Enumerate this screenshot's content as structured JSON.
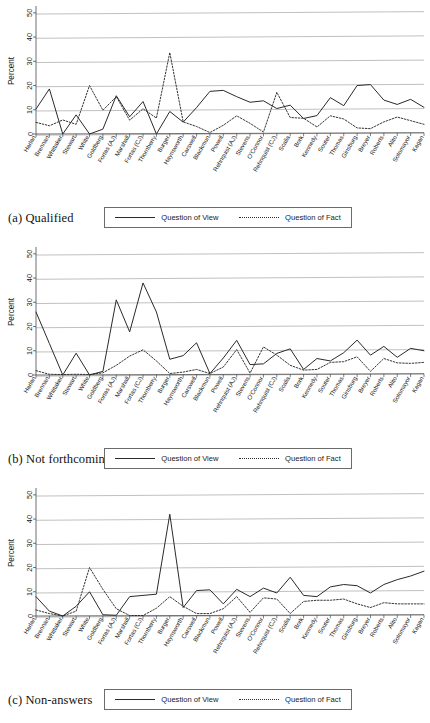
{
  "figure": {
    "ylabel": "Percent",
    "y_ticks": [
      0,
      10,
      20,
      30,
      40,
      50
    ],
    "ylim": [
      0,
      52
    ],
    "legend": {
      "view_label": "Question of View",
      "fact_label": "Question of Fact"
    },
    "colors": {
      "line": "#2a2a2a",
      "grid": "#b9b9b9",
      "axis": "#4a4a4a",
      "text": "#1a1a1a"
    },
    "categories": [
      "Harlan",
      "Brennan",
      "Whittaker",
      "Stewart",
      "White",
      "Goldberg",
      "Fortas (AJ)",
      "Marshall",
      "Fortas (CJ)",
      "Thornberry",
      "Burger",
      "Haynsworth",
      "Carswell",
      "Blackmun",
      "Powell",
      "Rehnquist (AJ)",
      "Stevens",
      "O'Connor",
      "Rehnquist (CJ)",
      "Scalia",
      "Bork",
      "Kennedy",
      "Souter",
      "Thomas",
      "Ginsburg",
      "Breyer",
      "Roberts",
      "Alito",
      "Sotomayor",
      "Kagan"
    ]
  },
  "panels": [
    {
      "id": "qualified",
      "caption": "(a) Qualified",
      "chart_data": {
        "type": "line",
        "title": "(a) Qualified",
        "xlabel": "",
        "ylabel": "Percent",
        "ylim": [
          0,
          52
        ],
        "grid": true,
        "legend_position": "bottom",
        "categories": [
          "Harlan",
          "Brennan",
          "Whittaker",
          "Stewart",
          "White",
          "Goldberg",
          "Fortas (AJ)",
          "Marshall",
          "Fortas (CJ)",
          "Thornberry",
          "Burger",
          "Haynsworth",
          "Carswell",
          "Blackmun",
          "Powell",
          "Rehnquist (AJ)",
          "Stevens",
          "O'Connor",
          "Rehnquist (CJ)",
          "Scalia",
          "Bork",
          "Kennedy",
          "Souter",
          "Thomas",
          "Ginsburg",
          "Breyer",
          "Roberts",
          "Alito",
          "Sotomayor",
          "Kagan"
        ],
        "series": [
          {
            "name": "Question of View",
            "style": "solid",
            "values": [
              10.3,
              18.6,
              0.0,
              7.9,
              0.0,
              2.0,
              15.8,
              7.1,
              13.4,
              0.0,
              9.3,
              4.9,
              10.9,
              17.6,
              18.0,
              15.4,
              13.1,
              13.7,
              10.5,
              11.9,
              6.4,
              7.6,
              15.0,
              11.7,
              20.0,
              20.4,
              14.0,
              12.2,
              14.3,
              11.0
            ]
          },
          {
            "name": "Question of Fact",
            "style": "dotted",
            "values": [
              4.8,
              3.4,
              5.8,
              4.0,
              20.0,
              9.8,
              15.4,
              5.7,
              10.4,
              6.6,
              33.6,
              5.0,
              3.1,
              0.6,
              3.6,
              7.5,
              4.4,
              0.8,
              17.2,
              6.8,
              6.5,
              2.9,
              7.5,
              6.2,
              2.5,
              2.2,
              5.0,
              7.0,
              5.5,
              4.0
            ]
          }
        ]
      }
    },
    {
      "id": "not-forthcoming",
      "caption": "(b) Not forthcoming",
      "chart_data": {
        "type": "line",
        "title": "(b) Not forthcoming",
        "xlabel": "",
        "ylabel": "Percent",
        "ylim": [
          0,
          52
        ],
        "grid": true,
        "legend_position": "bottom",
        "categories": [
          "Harlan",
          "Brennan",
          "Whittaker",
          "Stewart",
          "White",
          "Goldberg",
          "Fortas (AJ)",
          "Marshall",
          "Fortas (CJ)",
          "Thornberry",
          "Burger",
          "Haynsworth",
          "Carswell",
          "Blackmun",
          "Powell",
          "Rehnquist (AJ)",
          "Stevens",
          "O'Connor",
          "Rehnquist (CJ)",
          "Scalia",
          "Bork",
          "Kennedy",
          "Souter",
          "Thomas",
          "Ginsburg",
          "Breyer",
          "Roberts",
          "Alito",
          "Sotomayor",
          "Kagan"
        ],
        "series": [
          {
            "name": "Question of View",
            "style": "solid",
            "values": [
              26.0,
              13.0,
              0.0,
              9.0,
              0.0,
              1.5,
              31.0,
              17.8,
              38.0,
              26.0,
              6.5,
              8.0,
              13.3,
              0.6,
              7.0,
              14.3,
              4.3,
              4.6,
              8.9,
              10.8,
              2.3,
              6.8,
              5.8,
              9.2,
              14.4,
              8.2,
              11.8,
              7.3,
              11.0,
              10.0
            ]
          },
          {
            "name": "Question of Fact",
            "style": "dotted",
            "values": [
              1.8,
              0.3,
              0.2,
              0.3,
              0.2,
              0.9,
              4.0,
              7.8,
              10.4,
              5.8,
              0.6,
              1.2,
              2.3,
              0.6,
              3.3,
              10.5,
              0.8,
              11.6,
              8.2,
              4.0,
              2.0,
              2.3,
              5.2,
              5.5,
              7.5,
              1.5,
              6.8,
              5.0,
              4.8,
              5.2
            ]
          }
        ]
      }
    },
    {
      "id": "non-answers",
      "caption": "(c) Non-answers",
      "chart_data": {
        "type": "line",
        "title": "(c) Non-answers",
        "xlabel": "",
        "ylabel": "Percent",
        "ylim": [
          0,
          52
        ],
        "grid": true,
        "legend_position": "bottom",
        "categories": [
          "Harlan",
          "Brennan",
          "Whittaker",
          "Stewart",
          "White",
          "Goldberg",
          "Fortas (AJ)",
          "Marshall",
          "Fortas (CJ)",
          "Thornberry",
          "Burger",
          "Haynsworth",
          "Carswell",
          "Blackmun",
          "Powell",
          "Rehnquist (AJ)",
          "Stevens",
          "O'Connor",
          "Rehnquist (CJ)",
          "Scalia",
          "Bork",
          "Kennedy",
          "Souter",
          "Thomas",
          "Ginsburg",
          "Breyer",
          "Roberts",
          "Alito",
          "Sotomayor",
          "Kagan"
        ],
        "series": [
          {
            "name": "Question of View",
            "style": "solid",
            "values": [
              8.0,
              2.0,
              0.0,
              4.0,
              10.0,
              0.5,
              0.3,
              8.0,
              8.5,
              9.0,
              42.0,
              3.5,
              10.5,
              10.8,
              5.0,
              11.0,
              8.0,
              11.5,
              9.5,
              16.0,
              8.5,
              8.0,
              12.0,
              13.0,
              12.5,
              9.5,
              13.0,
              15.0,
              16.5,
              18.5
            ]
          },
          {
            "name": "Question of Fact",
            "style": "dotted",
            "values": [
              2.5,
              1.0,
              0.0,
              2.0,
              20.0,
              11.0,
              3.0,
              0.2,
              0.2,
              3.2,
              8.0,
              4.0,
              1.0,
              1.0,
              3.0,
              8.0,
              1.5,
              7.5,
              7.0,
              1.0,
              6.0,
              6.5,
              6.5,
              7.0,
              5.0,
              3.5,
              5.5,
              5.0,
              5.0,
              5.0
            ]
          }
        ]
      }
    }
  ]
}
